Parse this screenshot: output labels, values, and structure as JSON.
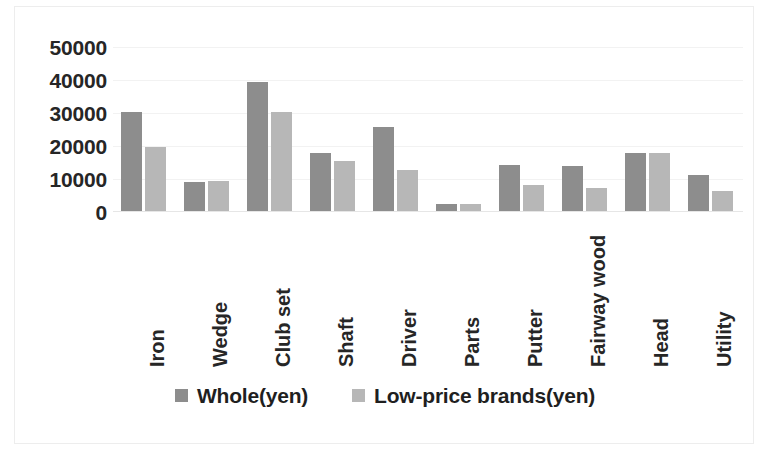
{
  "chart_data": {
    "type": "bar",
    "title": "",
    "subtitle": "",
    "xlabel": "",
    "ylabel": "",
    "ylim": [
      0,
      50000
    ],
    "ytick_labels": [
      "50000",
      "40000",
      "30000",
      "20000",
      "10000",
      "0"
    ],
    "yticks": [
      50000,
      40000,
      30000,
      20000,
      10000,
      0
    ],
    "grid": true,
    "legend_position": "bottom",
    "categories": [
      "Iron",
      "Wedge",
      "Club set",
      "Shaft",
      "Driver",
      "Parts",
      "Putter",
      "Fairway wood",
      "Head",
      "Utility"
    ],
    "series": [
      {
        "name": "Whole(yen)",
        "color": "#8d8d8d",
        "values": [
          30000,
          8800,
          39000,
          17500,
          25500,
          2000,
          14000,
          13500,
          17500,
          11000
        ]
      },
      {
        "name": "Low-price brands(yen)",
        "color": "#b7b7b7",
        "values": [
          19500,
          9000,
          30000,
          15300,
          12500,
          2000,
          7800,
          7000,
          17500,
          6200
        ]
      }
    ]
  },
  "legend": {
    "items": [
      {
        "label": "Whole(yen)",
        "color": "#8d8d8d",
        "swatch_name": "legend-swatch-whole"
      },
      {
        "label": "Low-price brands(yen)",
        "color": "#b7b7b7",
        "swatch_name": "legend-swatch-low-price"
      }
    ]
  }
}
